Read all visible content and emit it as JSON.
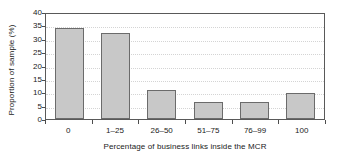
{
  "chart_data": {
    "type": "bar",
    "title": "",
    "subtitle": "",
    "xlabel": "Percentage of business links inside the MCR",
    "ylabel": "Proportion of sample (%)",
    "categories": [
      "0",
      "1–25",
      "26–50",
      "51–75",
      "76–99",
      "100"
    ],
    "values": [
      34.2,
      32.0,
      10.8,
      6.2,
      6.5,
      9.8
    ],
    "ylim": [
      0,
      40
    ],
    "yticks": [
      0,
      5,
      10,
      15,
      20,
      25,
      30,
      35,
      40
    ],
    "ytick_labels": [
      "0",
      "5",
      "10",
      "15",
      "20",
      "25",
      "30",
      "35",
      "40"
    ],
    "grid": true,
    "grid_axis": "y",
    "legend": false,
    "legend_position": "none",
    "bar_fill_color": "#c8c8c8",
    "bar_edge_color": "#6b6b6b",
    "plot_background": "#ffffff",
    "frame_color": "#595959",
    "gridline_color": "#d4d4d4",
    "series": [
      {
        "name": "Proportion of sample",
        "values": [
          34.2,
          32.0,
          10.8,
          6.2,
          6.5,
          9.8
        ]
      }
    ]
  }
}
